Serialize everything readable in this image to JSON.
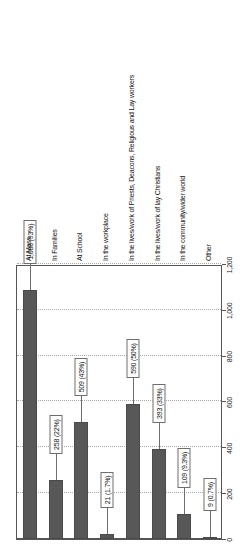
{
  "chart_data": {
    "type": "bar",
    "orientation": "vertical-rotated",
    "title": "",
    "subtitle": "",
    "xlabel": "",
    "ylabel": "",
    "ylim": [
      0,
      1200
    ],
    "grid": true,
    "legend": null,
    "tick_labels": [
      "0",
      "200",
      "400",
      "600",
      "800",
      "1,000",
      "1,200"
    ],
    "tick_values": [
      0,
      200,
      400,
      600,
      800,
      1000,
      1200
    ],
    "categories": [
      "At Mass",
      "In Families",
      "At School",
      "In the workplace",
      "In the lives/work of Priests, Deacons, Religious and Lay workers",
      "In the lives/work of lay Christians",
      "In the community/wider world",
      "Other"
    ],
    "values": [
      1088,
      258,
      509,
      21,
      590,
      393,
      109,
      9
    ],
    "percents": [
      "93%",
      "22%",
      "43%",
      "1.7%",
      "50%",
      "33%",
      "9.3%",
      "0.7%"
    ],
    "data_labels": [
      "1,088 (93%)",
      "258 (22%)",
      "509 (43%)",
      "21 (1.7%)",
      "590 (50%)",
      "393 (33%)",
      "109 (9.3%)",
      "9 (0.7%)"
    ],
    "colors": {
      "bar": "#585858",
      "bar_border": "#4a4a4a",
      "plot_background": "#ffffff",
      "axis": "#555555",
      "gridline": "#a9a9a9",
      "callout_border": "#6e6e6e",
      "text": "#111111"
    }
  }
}
